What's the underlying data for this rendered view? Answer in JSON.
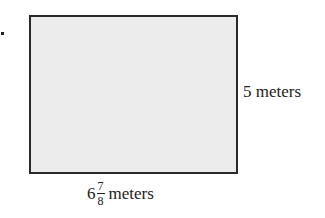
{
  "figure": {
    "shape": "rectangle",
    "fill_color": "#ececec",
    "stroke_color": "#2a2a2a",
    "bullet": "•"
  },
  "labels": {
    "height": "5 meters",
    "width": {
      "whole": "6",
      "numerator": "7",
      "denominator": "8",
      "unit": "meters"
    }
  }
}
